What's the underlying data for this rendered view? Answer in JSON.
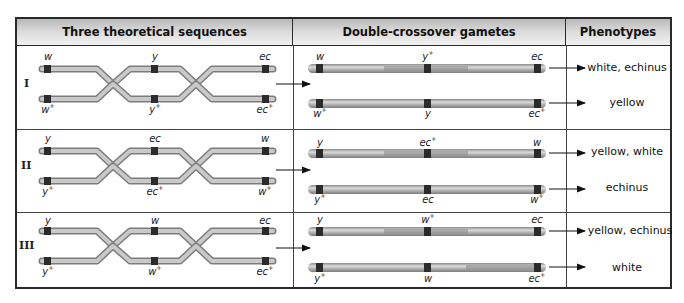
{
  "table": {
    "headers": [
      "Three theoretical sequences",
      "Double-crossover gametes",
      "Phenotypes"
    ],
    "rows": [
      {
        "label": "I",
        "sequences": {
          "top": [
            {
              "name": "w",
              "sup": ""
            },
            {
              "name": "y",
              "sup": ""
            },
            {
              "name": "ec",
              "sup": ""
            }
          ],
          "bottom": [
            {
              "name": "w",
              "sup": "+"
            },
            {
              "name": "y",
              "sup": "+"
            },
            {
              "name": "ec",
              "sup": "+"
            }
          ]
        },
        "gametes": [
          {
            "genes": [
              {
                "name": "w",
                "sup": ""
              },
              {
                "name": "y",
                "sup": "+"
              },
              {
                "name": "ec",
                "sup": ""
              }
            ],
            "phenotype": "white, echinus"
          },
          {
            "genes": [
              {
                "name": "w",
                "sup": "+"
              },
              {
                "name": "y",
                "sup": ""
              },
              {
                "name": "ec",
                "sup": "+"
              }
            ],
            "phenotype": "yellow"
          }
        ]
      },
      {
        "label": "II",
        "sequences": {
          "top": [
            {
              "name": "y",
              "sup": ""
            },
            {
              "name": "ec",
              "sup": ""
            },
            {
              "name": "w",
              "sup": ""
            }
          ],
          "bottom": [
            {
              "name": "y",
              "sup": "+"
            },
            {
              "name": "ec",
              "sup": "+"
            },
            {
              "name": "w",
              "sup": "+"
            }
          ]
        },
        "gametes": [
          {
            "genes": [
              {
                "name": "y",
                "sup": ""
              },
              {
                "name": "ec",
                "sup": "+"
              },
              {
                "name": "w",
                "sup": ""
              }
            ],
            "phenotype": "yellow, white"
          },
          {
            "genes": [
              {
                "name": "y",
                "sup": "+"
              },
              {
                "name": "ec",
                "sup": ""
              },
              {
                "name": "w",
                "sup": "+"
              }
            ],
            "phenotype": "echinus"
          }
        ]
      },
      {
        "label": "III",
        "sequences": {
          "top": [
            {
              "name": "y",
              "sup": ""
            },
            {
              "name": "w",
              "sup": ""
            },
            {
              "name": "ec",
              "sup": ""
            }
          ],
          "bottom": [
            {
              "name": "y",
              "sup": "+"
            },
            {
              "name": "w",
              "sup": "+"
            },
            {
              "name": "ec",
              "sup": "+"
            }
          ]
        },
        "gametes": [
          {
            "genes": [
              {
                "name": "y",
                "sup": ""
              },
              {
                "name": "w",
                "sup": "+"
              },
              {
                "name": "ec",
                "sup": ""
              }
            ],
            "phenotype": "yellow, echinus"
          },
          {
            "genes": [
              {
                "name": "y",
                "sup": "+"
              },
              {
                "name": "w",
                "sup": ""
              },
              {
                "name": "ec",
                "sup": "+"
              }
            ],
            "phenotype": "white"
          }
        ]
      }
    ]
  },
  "colors": {
    "border": "#2a2a2a",
    "chromosome": "#a8a8a8",
    "chromosome_highlight": "#d8d8d8",
    "chromosome_dark": "#7a7a7a",
    "gene_band": "#2b2b2b"
  }
}
